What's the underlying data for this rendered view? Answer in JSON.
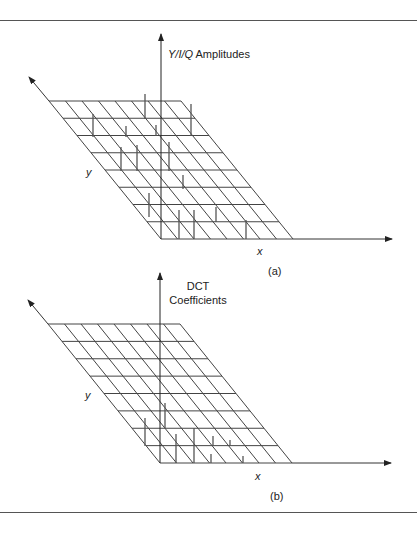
{
  "figure": {
    "border_color": "#555555",
    "line_color": "#444444",
    "panels": [
      {
        "id": "a",
        "caption": "(a)",
        "z_axis_label_italic": "Y/I/Q",
        "z_axis_label_rest": " Amplitudes",
        "x_axis_label": "x",
        "y_axis_label": "y",
        "grid": {
          "rows": 8,
          "cols": 8,
          "top_left": [
            49,
            101
          ],
          "bottom_left": [
            161,
            239
          ],
          "cell_width": 16.5
        },
        "axes": {
          "origin": [
            161,
            239
          ],
          "z_tip": [
            161,
            34
          ],
          "x_tip": [
            392,
            239
          ],
          "y_tip": [
            29,
            77
          ]
        },
        "spikes": [
          [
            145,
            94,
            119
          ],
          [
            191,
            104,
            136
          ],
          [
            93,
            114,
            137
          ],
          [
            126,
            126,
            137
          ],
          [
            156,
            125,
            136
          ],
          [
            121,
            147,
            171
          ],
          [
            137,
            145,
            171
          ],
          [
            169,
            142,
            171
          ],
          [
            183,
            175,
            189
          ],
          [
            149,
            193,
            217
          ],
          [
            179,
            210,
            239
          ],
          [
            194,
            210,
            239
          ],
          [
            216,
            207,
            222
          ],
          [
            246,
            220,
            239
          ]
        ]
      },
      {
        "id": "b",
        "caption": "(b)",
        "z_axis_label_line1": "DCT",
        "z_axis_label_line2": "Coefficients",
        "x_axis_label": "x",
        "y_axis_label": "y",
        "grid": {
          "rows": 8,
          "cols": 8,
          "top_left": [
            48,
            324
          ],
          "bottom_left": [
            160,
            463
          ],
          "cell_width": 16.5
        },
        "axes": {
          "origin": [
            160,
            463
          ],
          "z_tip": [
            160,
            273
          ],
          "x_tip": [
            391,
            463
          ],
          "y_tip": [
            28,
            300
          ]
        },
        "spikes": [
          [
            165,
            403,
            428
          ],
          [
            145,
            418,
            446
          ],
          [
            176,
            434,
            463
          ],
          [
            194,
            428,
            463
          ],
          [
            213,
            436,
            446
          ],
          [
            230,
            440,
            446
          ],
          [
            211,
            454,
            463
          ],
          [
            243,
            456,
            463
          ]
        ]
      }
    ]
  }
}
